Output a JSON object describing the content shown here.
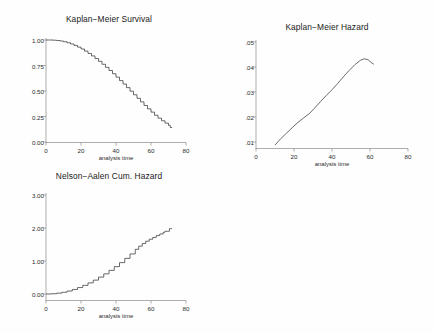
{
  "page": {
    "background": "#fefefe",
    "axis_color": "#8a8a8a",
    "curve_color": "#3a3a3a"
  },
  "panels": [
    {
      "name": "kaplan-meier-survival",
      "title": "Kaplan−Meier Survival",
      "xlabel": "analysis time",
      "xticks": [
        "0",
        "20",
        "40",
        "60",
        "80"
      ],
      "yticks": [
        "1.00",
        "0.75",
        "0.50",
        "0.25",
        "0.00"
      ]
    },
    {
      "name": "kaplan-meier-hazard",
      "title": "Kaplan−Meier Hazard",
      "xlabel": "analysis time",
      "xticks": [
        "0",
        "20",
        "40",
        "60",
        "80"
      ],
      "yticks": [
        ".05",
        ".04",
        ".03",
        ".02",
        ".01"
      ]
    },
    {
      "name": "nelson-aalen-cumulative-hazard",
      "title": "Nelson−Aalen Cum. Hazard",
      "xlabel": "analysis time",
      "xticks": [
        "0",
        "20",
        "40",
        "60",
        "80"
      ],
      "yticks": [
        "3.00",
        "2.00",
        "1.00",
        "0.00"
      ]
    }
  ],
  "chart_data": [
    {
      "type": "line",
      "title": "Kaplan−Meier Survival",
      "xlabel": "analysis time",
      "ylabel": "",
      "xlim": [
        0,
        80
      ],
      "ylim": [
        0,
        1.0
      ],
      "xticks": [
        0,
        20,
        40,
        60,
        80
      ],
      "yticks": [
        0.0,
        0.25,
        0.5,
        0.75,
        1.0
      ],
      "grid": false,
      "legend": "none",
      "step": true,
      "x": [
        0,
        2,
        4,
        6,
        8,
        10,
        12,
        14,
        16,
        18,
        20,
        22,
        24,
        26,
        28,
        30,
        32,
        34,
        36,
        38,
        40,
        42,
        44,
        46,
        48,
        50,
        52,
        54,
        56,
        58,
        60,
        62,
        64,
        66,
        68,
        70,
        71,
        72
      ],
      "y": [
        1.0,
        1.0,
        0.998,
        0.995,
        0.99,
        0.983,
        0.973,
        0.961,
        0.947,
        0.93,
        0.912,
        0.891,
        0.868,
        0.844,
        0.818,
        0.791,
        0.762,
        0.732,
        0.701,
        0.669,
        0.636,
        0.602,
        0.568,
        0.533,
        0.498,
        0.463,
        0.428,
        0.393,
        0.358,
        0.325,
        0.293,
        0.262,
        0.234,
        0.208,
        0.185,
        0.163,
        0.142,
        0.14
      ]
    },
    {
      "type": "line",
      "title": "Kaplan−Meier Hazard",
      "xlabel": "analysis time",
      "ylabel": "",
      "xlim": [
        0,
        80
      ],
      "ylim": [
        0.0,
        0.05
      ],
      "xticks": [
        0,
        20,
        40,
        60,
        80
      ],
      "yticks": [
        0.01,
        0.02,
        0.03,
        0.04,
        0.05
      ],
      "grid": false,
      "legend": "none",
      "step": false,
      "x": [
        10,
        13,
        16,
        19,
        22,
        25,
        28,
        31,
        34,
        37,
        40,
        43,
        46,
        49,
        52,
        55,
        57,
        59,
        61,
        62
      ],
      "y": [
        0.0088,
        0.0113,
        0.0135,
        0.0157,
        0.0178,
        0.0196,
        0.0213,
        0.0237,
        0.0262,
        0.0286,
        0.0309,
        0.0334,
        0.0361,
        0.0386,
        0.0409,
        0.0427,
        0.0433,
        0.0429,
        0.0416,
        0.0411
      ]
    },
    {
      "type": "line",
      "title": "Nelson−Aalen Cum. Hazard",
      "xlabel": "analysis time",
      "ylabel": "",
      "xlim": [
        0,
        80
      ],
      "ylim": [
        0.0,
        3.0
      ],
      "xticks": [
        0,
        20,
        40,
        60,
        80
      ],
      "yticks": [
        0.0,
        1.0,
        2.0,
        3.0
      ],
      "grid": false,
      "legend": "none",
      "step": true,
      "x": [
        0,
        3,
        6,
        9,
        12,
        15,
        18,
        21,
        24,
        27,
        30,
        33,
        36,
        39,
        42,
        45,
        48,
        51,
        53,
        55,
        57,
        59,
        61,
        63,
        65,
        67,
        68,
        69,
        70,
        70.5,
        71,
        72
      ],
      "y": [
        0.0,
        0.008,
        0.025,
        0.052,
        0.09,
        0.138,
        0.195,
        0.262,
        0.337,
        0.42,
        0.512,
        0.61,
        0.716,
        0.83,
        0.951,
        1.079,
        1.214,
        1.355,
        1.45,
        1.53,
        1.6,
        1.66,
        1.715,
        1.77,
        1.82,
        1.87,
        1.9,
        1.9,
        1.9,
        1.98,
        1.98,
        1.98
      ]
    }
  ]
}
